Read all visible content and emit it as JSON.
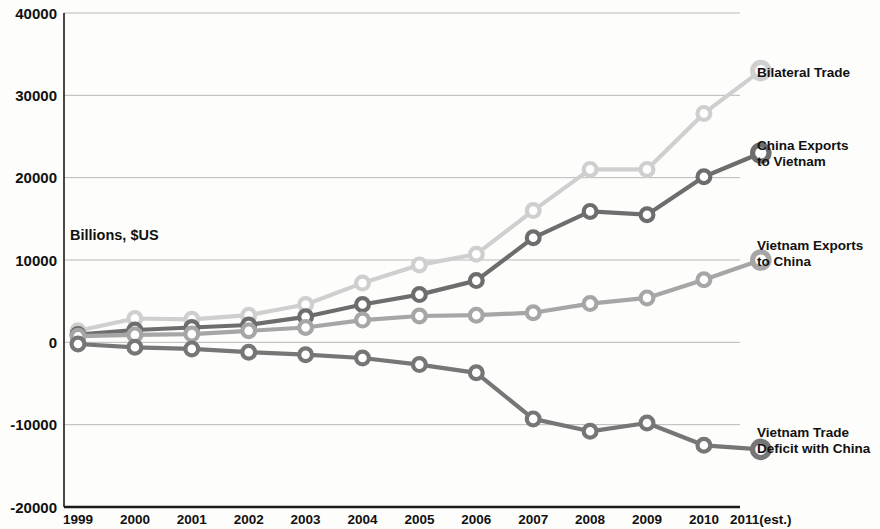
{
  "chart_data": {
    "type": "line",
    "title": "",
    "xlabel": "",
    "ylabel": "Billions, $US",
    "axis_note": "Billions, $US",
    "categories": [
      "1999",
      "2000",
      "2001",
      "2002",
      "2003",
      "2004",
      "2005",
      "2006",
      "2007",
      "2008",
      "2009",
      "2010",
      "2011(est.)"
    ],
    "ylim": [
      -20000,
      40000
    ],
    "yticks": [
      40000,
      30000,
      20000,
      10000,
      0,
      -10000,
      -20000
    ],
    "ytick_labels": [
      "40000",
      "30000",
      "20000",
      "10000",
      "0",
      "-10000",
      "-20000"
    ],
    "grid": true,
    "legend_position": "right-inline",
    "series": [
      {
        "name": "Bilateral Trade",
        "color": "#cfcfcf",
        "label_lines": [
          "Bilateral Trade"
        ],
        "values": [
          1400,
          2900,
          2800,
          3300,
          4600,
          7200,
          9400,
          10700,
          16000,
          21000,
          21000,
          27800,
          33000
        ]
      },
      {
        "name": "China Exports to Vietnam",
        "color": "#6d6d6d",
        "label_lines": [
          "China Exports",
          "to Vietnam"
        ],
        "values": [
          950,
          1500,
          1800,
          2100,
          3100,
          4600,
          5800,
          7500,
          12700,
          15900,
          15500,
          20100,
          23000
        ]
      },
      {
        "name": "Vietnam Exports to China",
        "color": "#a6a6a6",
        "label_lines": [
          "Vietnam Exports",
          "to China"
        ],
        "values": [
          750,
          900,
          1000,
          1400,
          1800,
          2700,
          3200,
          3300,
          3600,
          4700,
          5400,
          7600,
          10000
        ]
      },
      {
        "name": "Vietnam Trade Deficit with China",
        "color": "#767676",
        "label_lines": [
          "Vietnam Trade",
          "Deficit with China"
        ],
        "values": [
          -200,
          -600,
          -800,
          -1200,
          -1500,
          -1900,
          -2700,
          -3700,
          -9300,
          -10800,
          -9800,
          -12500,
          -13000
        ]
      }
    ]
  }
}
